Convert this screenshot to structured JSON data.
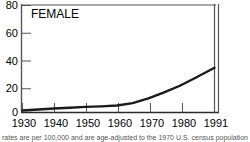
{
  "figure": {
    "title": "FEMALE",
    "footnote": "rates are per 100,000 and are age-adjusted to the 1970 U.S. census population"
  },
  "chart_data": {
    "type": "line",
    "title": "FEMALE",
    "xlabel": "",
    "ylabel": "",
    "xlim": [
      1930,
      1991
    ],
    "ylim": [
      0,
      80
    ],
    "grid": false,
    "legend": null,
    "line_color": "#1a1a1a",
    "x_ticks": [
      1930,
      1940,
      1950,
      1960,
      1970,
      1980,
      1991
    ],
    "x_tick_labels": [
      "1930",
      "1940",
      "1950",
      "1960",
      "1970",
      "1980",
      "1991"
    ],
    "y_ticks": [
      0,
      20,
      40,
      60,
      80
    ],
    "y_tick_labels": [
      "0",
      "20",
      "40",
      "60",
      "80"
    ],
    "series": [
      {
        "name": "FEMALE",
        "x": [
          1930,
          1935,
          1940,
          1945,
          1950,
          1955,
          1960,
          1965,
          1970,
          1975,
          1980,
          1985,
          1991
        ],
        "values": [
          1.5,
          2.2,
          3.0,
          3.6,
          4.2,
          4.6,
          5.2,
          7.0,
          10.5,
          15.0,
          20.0,
          26.0,
          33.5
        ]
      }
    ],
    "annotations": [
      "axis-break at right edge"
    ]
  }
}
